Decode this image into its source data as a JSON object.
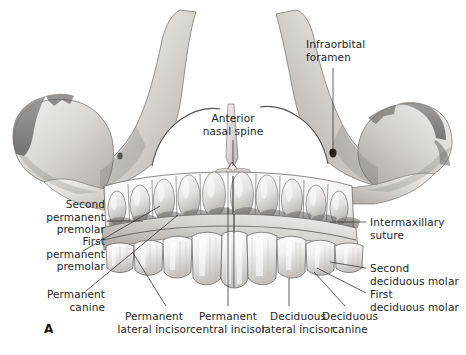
{
  "figure": {
    "panel_letter": "A",
    "caption_title": "Maxilla of a child: anterior view with deciduous teeth and permanent tooth crypts",
    "background_color": "#ffffff",
    "ink_color": "#231f1f",
    "leader_color": "#3a3636",
    "width": 466,
    "height": 355
  },
  "labels": [
    {
      "id": "infraorbital-foramen",
      "text": "Infraorbital\nforamen",
      "align": "left",
      "x": 306,
      "y": 38,
      "leader": {
        "x1": 333,
        "y1": 68,
        "x2": 333,
        "y2": 153
      }
    },
    {
      "id": "anterior-nasal-spine",
      "text": "Anterior\nnasal spine",
      "align": "center",
      "x": 186,
      "y": 112,
      "leader": {
        "x1": 233,
        "y1": 140,
        "x2": 233,
        "y2": 166
      }
    },
    {
      "id": "second-permanent-premolar",
      "text": "Second\npermanent\npremolar",
      "align": "right",
      "x": 27,
      "y": 198,
      "leader": {
        "x1": 107,
        "y1": 221,
        "x2": 143,
        "y2": 221
      }
    },
    {
      "id": "intermaxillary-suture",
      "text": "Intermaxillary\nsuture",
      "align": "left",
      "x": 370,
      "y": 216,
      "leader": {
        "x1": 366,
        "y1": 222,
        "x2": 330,
        "y2": 222
      }
    },
    {
      "id": "first-permanent-premolar",
      "text": "First\npermanent\npremolar",
      "align": "right",
      "x": 27,
      "y": 235,
      "leader": {
        "x1": 83,
        "y1": 251,
        "x2": 160,
        "y2": 206
      }
    },
    {
      "id": "second-deciduous-molar",
      "text": "Second\ndeciduous molar",
      "align": "left",
      "x": 370,
      "y": 262,
      "leader": {
        "x1": 366,
        "y1": 268,
        "x2": 330,
        "y2": 262
      }
    },
    {
      "id": "permanent-canine",
      "text": "Permanent\ncanine",
      "align": "right",
      "x": 27,
      "y": 288,
      "leader": {
        "x1": 86,
        "y1": 291,
        "x2": 178,
        "y2": 215
      }
    },
    {
      "id": "first-deciduous-molar",
      "text": "First\ndeciduous molar",
      "align": "left",
      "x": 370,
      "y": 288,
      "leader": {
        "x1": 366,
        "y1": 293,
        "x2": 317,
        "y2": 268
      }
    },
    {
      "id": "permanent-lateral-incisor",
      "text": "Permanent\nlateral incisor",
      "align": "center",
      "x": 112,
      "y": 310,
      "leader": {
        "x1": 166,
        "y1": 306,
        "x2": 133,
        "y2": 253
      }
    },
    {
      "id": "permanent-central-incisor",
      "text": "Permanent\ncentral incisor",
      "align": "center",
      "x": 182,
      "y": 310,
      "leader": {
        "x1": 228,
        "y1": 306,
        "x2": 228,
        "y2": 207
      }
    },
    {
      "id": "deciduous-lateral-incisor",
      "text": "Deciduous\nlateral incisor",
      "align": "center",
      "x": 257,
      "y": 310,
      "leader": {
        "x1": 289,
        "y1": 306,
        "x2": 289,
        "y2": 278
      }
    },
    {
      "id": "deciduous-canine",
      "text": "Deciduous\ncanine",
      "align": "center",
      "x": 315,
      "y": 310,
      "leader": {
        "x1": 345,
        "y1": 306,
        "x2": 314,
        "y2": 272
      }
    }
  ],
  "anatomy": {
    "view": "anterior",
    "bone": "maxilla",
    "subject": "child",
    "structures": [
      "frontal process of maxilla",
      "zygomatic process",
      "nasal aperture",
      "anterior nasal spine",
      "infraorbital foramen",
      "intermaxillary suture",
      "alveolar process",
      "permanent tooth crypts",
      "deciduous tooth crowns"
    ],
    "deciduous_teeth_visible": 10,
    "permanent_crypts_visible": 10
  }
}
